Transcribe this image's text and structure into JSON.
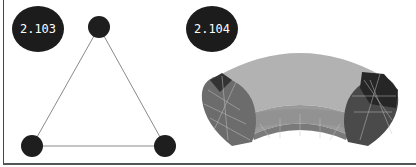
{
  "figures": [
    {
      "label": "2.103",
      "description": "Triangle graph with three nodes",
      "nodes": [
        {
          "id": "top",
          "x": 99,
          "y": 27
        },
        {
          "id": "bottom-left",
          "x": 32,
          "y": 146
        },
        {
          "id": "bottom-right",
          "x": 165,
          "y": 146
        }
      ],
      "edges": [
        [
          "top",
          "bottom-left"
        ],
        [
          "top",
          "bottom-right"
        ],
        [
          "bottom-left",
          "bottom-right"
        ]
      ],
      "colors": {
        "node": "#1e1e1e",
        "edge": "#888888"
      }
    },
    {
      "label": "2.104",
      "description": "Curved tube (torus segment) triangle mesh, shaded grey",
      "colors": {
        "top_surface": "#b4b4b4",
        "mid_band": "#9a9a9a",
        "lower_band": "#7a7a7a",
        "left_cap": "#6a6a6a",
        "right_cap": "#3a3a3a",
        "mesh_line": "#c8c8c8"
      }
    }
  ]
}
